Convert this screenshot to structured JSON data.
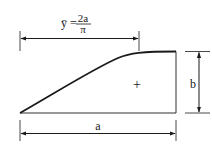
{
  "diagram": {
    "type": "area-centroid-figure",
    "shape": "region under a sinusoidal (quarter-cosine) curve",
    "colors": {
      "line": "#1a1a1a",
      "background": "#ffffff"
    },
    "formula": {
      "lhs": "ȳ",
      "equals": "=",
      "numerator": "2a",
      "denominator": "π"
    },
    "labels": {
      "width": "a",
      "height": "b",
      "centroid_marker": "+"
    }
  }
}
